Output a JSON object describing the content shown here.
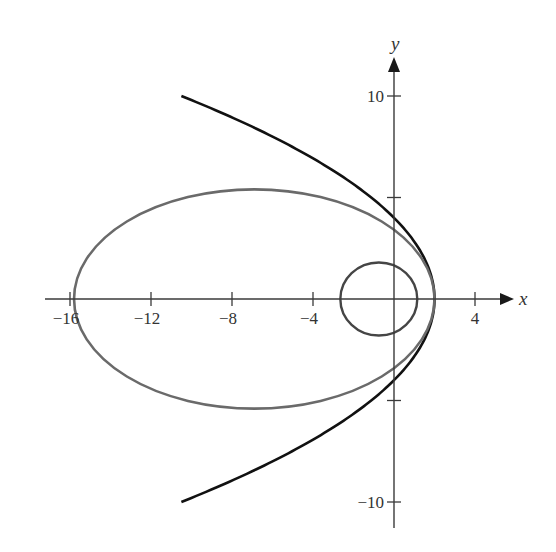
{
  "chart_data": {
    "type": "line",
    "title": "",
    "xlabel": "x",
    "ylabel": "y",
    "xlim": [
      -16.2,
      5.8
    ],
    "ylim": [
      -11.5,
      11.8
    ],
    "grid": false,
    "legend": null,
    "x_ticks": [
      -16,
      -12,
      -8,
      -4,
      4
    ],
    "x_tick_labels": [
      "−16",
      "−12",
      "−8",
      "−4",
      "4"
    ],
    "y_ticks": [
      10,
      5,
      -5,
      -10
    ],
    "y_tick_labels": [
      "10",
      "",
      "",
      "−10"
    ],
    "series": [
      {
        "name": "parabola",
        "kind": "parabola",
        "equation": "x = 2 - y^2/8",
        "vertex": [
          2,
          0
        ],
        "y_range": [
          -10,
          10
        ],
        "color": "#111111",
        "stroke_width": 2.6
      },
      {
        "name": "ellipse",
        "kind": "ellipse",
        "center": [
          -6.9,
          0
        ],
        "semi_axis_x": 8.9,
        "semi_axis_y": 5.4,
        "color": "#6a6a6a",
        "stroke_width": 2.6
      },
      {
        "name": "circle",
        "kind": "ellipse",
        "center": [
          -0.75,
          0
        ],
        "semi_axis_x": 1.9,
        "semi_axis_y": 1.8,
        "color": "#454545",
        "stroke_width": 2.4
      }
    ],
    "axes_color": "#3a3a3a"
  }
}
